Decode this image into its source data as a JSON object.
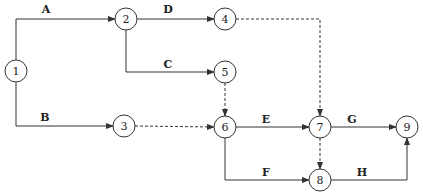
{
  "diagram": {
    "type": "activity-on-arrow network",
    "nodes": [
      {
        "id": "1",
        "label": "1",
        "x": 16,
        "y": 71
      },
      {
        "id": "2",
        "label": "2",
        "x": 126,
        "y": 19
      },
      {
        "id": "3",
        "label": "3",
        "x": 124,
        "y": 126
      },
      {
        "id": "4",
        "label": "4",
        "x": 225,
        "y": 19
      },
      {
        "id": "5",
        "label": "5",
        "x": 225,
        "y": 72
      },
      {
        "id": "6",
        "label": "6",
        "x": 225,
        "y": 127
      },
      {
        "id": "7",
        "label": "7",
        "x": 320,
        "y": 127
      },
      {
        "id": "8",
        "label": "8",
        "x": 320,
        "y": 180
      },
      {
        "id": "9",
        "label": "9",
        "x": 407,
        "y": 127
      }
    ],
    "edges": [
      {
        "from": "1",
        "to": "2",
        "label": "A",
        "dummy": false
      },
      {
        "from": "1",
        "to": "3",
        "label": "B",
        "dummy": false
      },
      {
        "from": "2",
        "to": "5",
        "label": "C",
        "dummy": false
      },
      {
        "from": "2",
        "to": "4",
        "label": "D",
        "dummy": false
      },
      {
        "from": "6",
        "to": "7",
        "label": "E",
        "dummy": false
      },
      {
        "from": "6",
        "to": "8",
        "label": "F",
        "dummy": false
      },
      {
        "from": "7",
        "to": "9",
        "label": "G",
        "dummy": false
      },
      {
        "from": "8",
        "to": "9",
        "label": "H",
        "dummy": false
      },
      {
        "from": "4",
        "to": "7",
        "label": "",
        "dummy": true
      },
      {
        "from": "5",
        "to": "6",
        "label": "",
        "dummy": true
      },
      {
        "from": "3",
        "to": "6",
        "label": "",
        "dummy": true
      },
      {
        "from": "7",
        "to": "8",
        "label": "",
        "dummy": true
      }
    ],
    "labels": {
      "A": "A",
      "B": "B",
      "C": "C",
      "D": "D",
      "E": "E",
      "F": "F",
      "G": "G",
      "H": "H"
    },
    "node_labels": {
      "n1": "1",
      "n2": "2",
      "n3": "3",
      "n4": "4",
      "n5": "5",
      "n6": "6",
      "n7": "7",
      "n8": "8",
      "n9": "9"
    }
  }
}
